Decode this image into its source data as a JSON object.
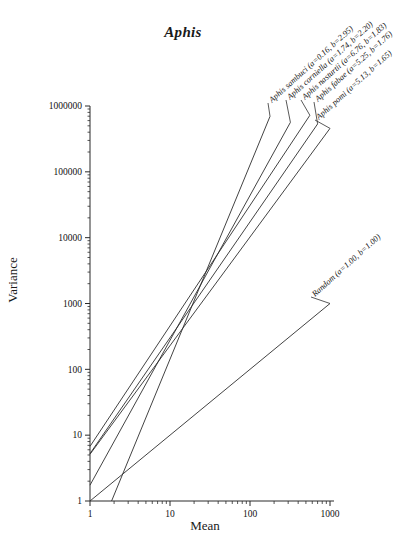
{
  "chart_data": {
    "type": "line",
    "title": "Aphis",
    "xlabel": "Mean",
    "ylabel": "Variance",
    "xscale": "log",
    "yscale": "log",
    "xlim": [
      1,
      1000
    ],
    "ylim": [
      1,
      1000000
    ],
    "grid": false,
    "legend_position": "inline-rotated-labels-right",
    "xticks": [
      "1",
      "10",
      "100",
      "1000"
    ],
    "xtick_values": [
      1,
      10,
      100,
      1000
    ],
    "yticks": [
      "1",
      "10",
      "100",
      "1000",
      "10000",
      "100000",
      "1000000"
    ],
    "ytick_values": [
      1,
      10,
      100,
      1000,
      10000,
      100000,
      1000000
    ],
    "model": "V = a * M^b",
    "series": [
      {
        "name": "Aphis sambuci",
        "label": "Aphis sambuci (a=0.16, b=2.95)",
        "a": 0.16,
        "b": 2.95,
        "x_start": 1.0,
        "x_end": 178.0,
        "y_start": 0.16,
        "y_end": 495000
      },
      {
        "name": "Aphis corniella",
        "label": "Aphis corniella (a=1.74, b=2.20)",
        "a": 1.74,
        "b": 2.2,
        "x_start": 1.0,
        "x_end": 320.0,
        "y_start": 1.74,
        "y_end": 513000
      },
      {
        "name": "Aphis nasturtii",
        "label": "Aphis nasturtii (a=6.76, b=1.83)",
        "a": 6.76,
        "b": 1.83,
        "x_start": 1.0,
        "x_end": 560.0,
        "y_start": 6.76,
        "y_end": 610000
      },
      {
        "name": "Aphis fabae",
        "label": "Aphis fabae (a=5.25, b=1.76)",
        "a": 5.25,
        "b": 1.76,
        "x_start": 1.0,
        "x_end": 700.0,
        "y_start": 5.25,
        "y_end": 630000
      },
      {
        "name": "Aphis pomi",
        "label": "Aphis pomi (a=5.13, b=1.65)",
        "a": 5.13,
        "b": 1.65,
        "x_start": 1.0,
        "x_end": 1000.0,
        "y_start": 5.13,
        "y_end": 399000
      },
      {
        "name": "Random",
        "label": "Random (a=1.00, b=1.00)",
        "a": 1.0,
        "b": 1.0,
        "x_start": 1.0,
        "x_end": 1000.0,
        "y_start": 1.0,
        "y_end": 1000
      }
    ]
  },
  "axes": {
    "title": "Aphis",
    "xlabel": "Mean",
    "ylabel": "Variance"
  }
}
